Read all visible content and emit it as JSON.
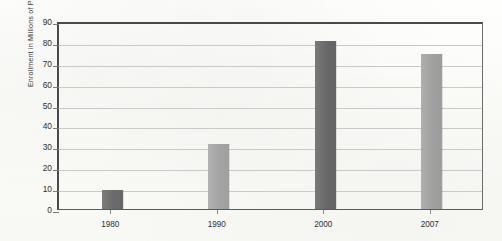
{
  "chart_data": {
    "type": "bar",
    "title": "",
    "subtitle": "",
    "xlabel": "",
    "ylabel": "Enrollment in Millions of Persons",
    "categories": [
      "1980",
      "1990",
      "2000",
      "2007"
    ],
    "values": [
      9,
      31,
      80.5,
      74
    ],
    "series": [
      {
        "name": "Enrollment",
        "values": [
          9,
          31,
          80.5,
          74
        ]
      }
    ],
    "bar_colors": [
      "#6e6e6e",
      "#a9a9a9",
      "#6b6b6b",
      "#a6a6a6"
    ],
    "ylim": [
      0,
      90
    ],
    "ytick_values": [
      0,
      10,
      20,
      30,
      40,
      50,
      60,
      70,
      80,
      90
    ],
    "ytick_labels": [
      "0",
      "10",
      "20",
      "30",
      "40",
      "50",
      "60",
      "70",
      "80",
      "90"
    ],
    "grid": true,
    "grid_axis": "y",
    "legend": false,
    "legend_position": "none",
    "annotations": [],
    "background_color": "#fbfbf8",
    "grid_color": "#c9c9c9",
    "axis_color": "#4a4a4a",
    "text_color": "#2f2f2f"
  }
}
